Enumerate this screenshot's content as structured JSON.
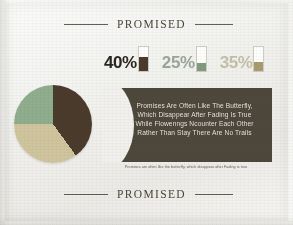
{
  "poster": {
    "background_color": "#f0efec",
    "header": {
      "title": "PROMISED",
      "rule_color": "#4a4439"
    },
    "footer": {
      "title": "PROMISED"
    }
  },
  "stats": [
    {
      "name": "stat-40",
      "value": "40%",
      "fill_percent": 58,
      "text_color": "#2b2620",
      "fill_color": "#4a3b2c",
      "box_color": "#fdfdfc"
    },
    {
      "name": "stat-25",
      "value": "25%",
      "fill_percent": 34,
      "text_color": "#9aa69a",
      "fill_color": "#7f9c80",
      "box_color": "#fdfdfc"
    },
    {
      "name": "stat-35",
      "value": "35%",
      "fill_percent": 36,
      "text_color": "#c3bfa8",
      "fill_color": "#a69c6e",
      "box_color": "#fdfdfc"
    }
  ],
  "chart_data": {
    "type": "pie",
    "title": "PROMISED",
    "categories": [
      "40%",
      "35%",
      "25%"
    ],
    "values": [
      40,
      35,
      25
    ],
    "colors": [
      "#4a3b2c",
      "#cfc49e",
      "#8fae8d"
    ],
    "labels_shown": false,
    "legend": "none",
    "start_angle_deg": 0
  },
  "bubble": {
    "background_color": "#4e483c",
    "text_color": "#ece9e1",
    "lines": [
      "Promises Are Often Like The Butterfly,",
      "Which Disappear After Fading Is True",
      "While Flowenngs Ncounter Each Other",
      "Rather Than Stay  There Are No Trails"
    ]
  },
  "caption": {
    "text": "Promises are often like the butterfly, which disappear after Fading is true"
  }
}
